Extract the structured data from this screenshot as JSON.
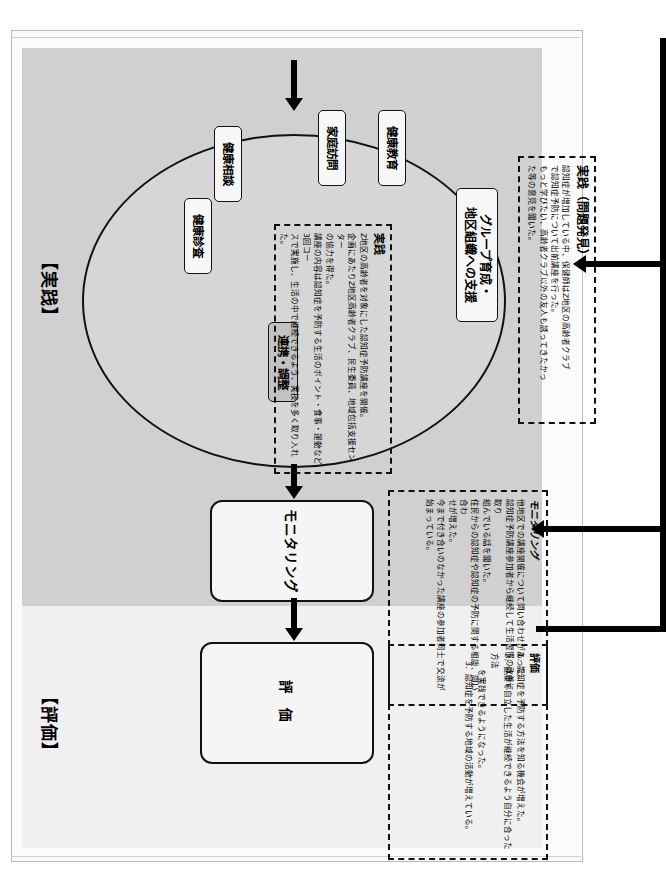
{
  "document": {
    "title": "保健師活動 実践・評価 プロセス図",
    "orientation": "rotated-90-clockwise"
  },
  "bands": [
    {
      "id": "jissen",
      "label": "【実践】",
      "color": "#d0d0d0"
    },
    {
      "id": "hyoka",
      "label": "【評価】",
      "color": "#f0f0f0"
    }
  ],
  "ellipse": {
    "name": "実践活動群",
    "nodes": [
      {
        "id": "group",
        "label": "グループ育成・\n地区組織への支援"
      },
      {
        "id": "kyoiku",
        "label": "健康教育"
      },
      {
        "id": "katei",
        "label": "家庭訪問"
      },
      {
        "id": "sodan",
        "label": "健康相談"
      },
      {
        "id": "shinsa",
        "label": "健康診査"
      },
      {
        "id": "renkei",
        "label": "連携・調整"
      }
    ]
  },
  "flow": {
    "boxes": [
      {
        "id": "monitoring",
        "label": "モニタリング"
      },
      {
        "id": "evaluation",
        "label": "評 価"
      }
    ]
  },
  "annotations": {
    "jissen_problem": {
      "title": "実践（問題発見）",
      "body": "認知症が増加している中、保健師はZ地区の高齢者クラブ\nで認知症予防について出前講座を行った。\nもっと学びたい、高齢者クラブ以外の友人も誘ってきたかっ\nた等の意見を聞いた。"
    },
    "jissen_detail": {
      "title": "実践",
      "body": "Z地区の高齢者を対象にした認知症予防講座を開催。\n企画にあたりZ地区高齢者クラブ、民生委員、地域包括支援センター\nの協力を得た。\n講座の内容は認知症を予防する生活のポイント・食事・運動など3回コー\nスで実施し、生活の中で継続できるよう、実技を多く取り入れた。"
    },
    "monitoring": {
      "title": "モニタリング",
      "body": "他地区での講座開催について問い合わせがあった。\n認知症予防講座参加者から継続して生活習慣の改善に取り\n組んでいる話を聞いた。\n住民からの認知症や認知症の予防に関する相談、問い合わ\nせが増えた。\n今まで付き合いのなかった講座の参加者同士で交流が始まっている。"
    },
    "evaluation": {
      "title": "評価",
      "body": "1．認知症を予防する方法を知る機会が増えた。\n2．健康で自立した生活が継続できるよう自分に合った方法\n　　を実践できるようになった。\n　3．認知症を予防する地域の活動が増えている。"
    }
  },
  "icons": {
    "arrow_right": "arrow-right-icon",
    "arrow_down": "arrow-down-icon"
  },
  "colors": {
    "band_practice": "#d0d0d0",
    "band_evaluation": "#f0f0f0",
    "ellipse_fill": "#d6d6d6",
    "node_fill": "#f7f7f7",
    "accent_node_fill": "#c2c2c2",
    "line": "#000000"
  }
}
